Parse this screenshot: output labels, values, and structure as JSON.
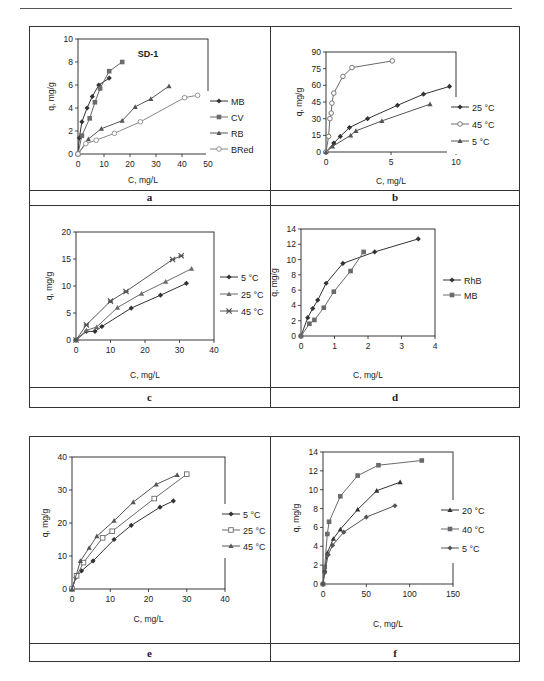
{
  "panels": [
    {
      "label": "a"
    },
    {
      "label": "b"
    },
    {
      "label": "c"
    },
    {
      "label": "d"
    },
    {
      "label": "e"
    },
    {
      "label": "f"
    }
  ],
  "chart_data": [
    {
      "panel": "a",
      "type": "line",
      "title": "SD-1",
      "xlabel": "C, mg/L",
      "ylabel": "q, mg/g",
      "xlim": [
        0,
        50
      ],
      "ylim": [
        0,
        10
      ],
      "xticks": [
        0,
        10,
        20,
        30,
        40,
        50
      ],
      "yticks": [
        0,
        2,
        4,
        6,
        8,
        10
      ],
      "legend_position": "right",
      "series": [
        {
          "name": "MB",
          "marker": "diamond-filled",
          "x": [
            0,
            0.5,
            1.5,
            3.5,
            5.5,
            8,
            12
          ],
          "y": [
            0,
            1.4,
            2.8,
            4.0,
            5.0,
            6.0,
            6.6
          ]
        },
        {
          "name": "CV",
          "marker": "square-filled",
          "x": [
            0,
            1.5,
            4.5,
            6.5,
            8.5,
            12,
            17
          ],
          "y": [
            0,
            1.6,
            3.1,
            4.5,
            5.7,
            7.2,
            8.0
          ]
        },
        {
          "name": "RB",
          "marker": "triangle-filled",
          "x": [
            0,
            4,
            9,
            17,
            22,
            28,
            35
          ],
          "y": [
            0,
            1.3,
            2.2,
            2.9,
            4.1,
            4.8,
            5.9
          ]
        },
        {
          "name": "BRed",
          "marker": "circle-open",
          "x": [
            0,
            3,
            7,
            14,
            24,
            41,
            46
          ],
          "y": [
            0,
            0.9,
            1.2,
            1.8,
            2.8,
            4.9,
            5.1
          ]
        }
      ]
    },
    {
      "panel": "b",
      "type": "line",
      "xlabel": "C, mg/L",
      "ylabel": "q, mg/g",
      "xlim": [
        0,
        10
      ],
      "ylim": [
        0,
        90
      ],
      "xticks": [
        0,
        5,
        10
      ],
      "yticks": [
        0,
        15,
        30,
        45,
        60,
        75,
        90
      ],
      "legend_position": "right",
      "series": [
        {
          "name": "25 °C",
          "marker": "diamond-filled",
          "x": [
            0,
            0.6,
            1.1,
            1.8,
            3.2,
            5.5,
            7.5,
            9.5
          ],
          "y": [
            0,
            8,
            14,
            22,
            30,
            42,
            52,
            59
          ]
        },
        {
          "name": "45 °C",
          "marker": "circle-open",
          "x": [
            0,
            0.2,
            0.3,
            0.4,
            0.45,
            0.6,
            1.3,
            2.0,
            5.1
          ],
          "y": [
            0,
            14,
            30,
            35,
            44,
            53,
            68,
            76,
            82
          ]
        },
        {
          "name": "5 °C",
          "marker": "triangle-filled",
          "x": [
            0,
            0.5,
            1.9,
            2.3,
            4.3,
            8.0
          ],
          "y": [
            0,
            5,
            15,
            19,
            28,
            43
          ]
        }
      ]
    },
    {
      "panel": "c",
      "type": "line",
      "xlabel": "C, mg/L",
      "ylabel": "q, mg/g",
      "xlim": [
        0,
        40
      ],
      "ylim": [
        0,
        20
      ],
      "xticks": [
        0,
        10,
        20,
        30,
        40
      ],
      "yticks": [
        0,
        5,
        10,
        15,
        20
      ],
      "legend_position": "right",
      "series": [
        {
          "name": "5 °C",
          "marker": "diamond-filled",
          "x": [
            0,
            3,
            5.5,
            7.5,
            16,
            24.5,
            32
          ],
          "y": [
            0,
            1.6,
            1.6,
            2.5,
            5.9,
            8.3,
            10.5
          ]
        },
        {
          "name": "25 °C",
          "marker": "triangle-filled",
          "x": [
            0,
            3,
            6,
            12,
            19,
            26,
            33.5
          ],
          "y": [
            0,
            1.8,
            2.4,
            6.0,
            8.6,
            10.8,
            13.2
          ]
        },
        {
          "name": "45 °C",
          "marker": "star",
          "x": [
            0,
            3,
            10,
            14.5,
            28,
            30.5
          ],
          "y": [
            0,
            2.8,
            7.2,
            9.0,
            14.9,
            15.6
          ]
        }
      ]
    },
    {
      "panel": "d",
      "type": "line",
      "xlabel": "C, mg/L",
      "ylabel": "q, mg/g",
      "xlim": [
        0,
        4
      ],
      "ylim": [
        0,
        14
      ],
      "xticks": [
        0,
        1,
        2,
        3,
        4
      ],
      "yticks": [
        0,
        2,
        4,
        6,
        8,
        10,
        12,
        14
      ],
      "legend_position": "right",
      "series": [
        {
          "name": "RhB",
          "marker": "diamond-filled",
          "x": [
            0,
            0.2,
            0.35,
            0.5,
            0.75,
            1.25,
            2.2,
            3.5
          ],
          "y": [
            0,
            2.4,
            3.6,
            4.7,
            6.9,
            9.5,
            11.0,
            12.7
          ]
        },
        {
          "name": "MB",
          "marker": "square-filled",
          "x": [
            0,
            0.25,
            0.4,
            0.68,
            0.98,
            1.48,
            1.87
          ],
          "y": [
            0,
            1.6,
            2.1,
            3.7,
            5.8,
            8.5,
            11.0
          ]
        }
      ]
    },
    {
      "panel": "e",
      "type": "line",
      "xlabel": "C, mg/L",
      "ylabel": "q, mg/g",
      "xlim": [
        0,
        40
      ],
      "ylim": [
        0,
        40
      ],
      "xticks": [
        0,
        10,
        20,
        30,
        40
      ],
      "yticks": [
        0,
        10,
        20,
        30,
        40
      ],
      "legend_position": "right",
      "series": [
        {
          "name": "5 °C",
          "marker": "diamond-filled",
          "x": [
            0,
            1,
            2.5,
            5.5,
            11,
            15.5,
            23,
            26.5
          ],
          "y": [
            0,
            3.5,
            5.5,
            8.5,
            15,
            19.3,
            24.8,
            26.7
          ]
        },
        {
          "name": "25 °C",
          "marker": "square-open",
          "x": [
            0,
            1.2,
            3,
            8,
            10.5,
            21.5,
            30
          ],
          "y": [
            0,
            4,
            8,
            15.5,
            17.5,
            27.4,
            34.8
          ]
        },
        {
          "name": "45 °C",
          "marker": "triangle-filled",
          "x": [
            0,
            2.2,
            4.5,
            6.5,
            11,
            16,
            22,
            27.5
          ],
          "y": [
            0,
            8.5,
            12.5,
            16,
            20.7,
            26.3,
            31.7,
            34.6
          ]
        }
      ]
    },
    {
      "panel": "f",
      "type": "line",
      "xlabel": "C, mg/L",
      "ylabel": "q, mg/g",
      "xlim": [
        0,
        150
      ],
      "ylim": [
        0,
        14
      ],
      "xticks": [
        0,
        50,
        100,
        150
      ],
      "yticks": [
        0,
        2,
        4,
        6,
        8,
        10,
        12,
        14
      ],
      "legend_position": "right",
      "series": [
        {
          "name": "20 °C",
          "marker": "triangle-filled",
          "x": [
            0,
            2,
            5,
            12,
            20,
            40,
            62,
            89
          ],
          "y": [
            0,
            1.5,
            3.3,
            4.8,
            5.8,
            7.9,
            9.9,
            10.8
          ]
        },
        {
          "name": "40 °C",
          "marker": "square-filled",
          "x": [
            0,
            2,
            5,
            7,
            20,
            40,
            64,
            114
          ],
          "y": [
            0,
            1.8,
            5.3,
            6.6,
            9.3,
            11.5,
            12.6,
            13.1
          ]
        },
        {
          "name": "5 °C",
          "marker": "diamond-filled",
          "x": [
            0,
            2,
            6,
            11,
            24,
            50,
            83
          ],
          "y": [
            0,
            1.2,
            3.1,
            4.1,
            5.5,
            7.1,
            8.3
          ]
        }
      ]
    }
  ]
}
